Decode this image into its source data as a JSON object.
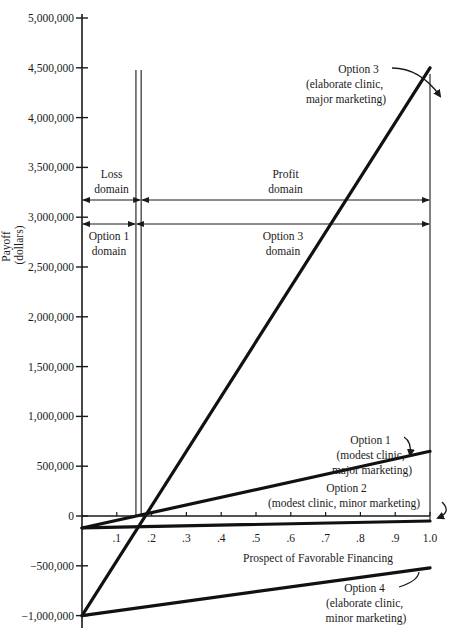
{
  "chart_data": {
    "type": "line",
    "title": "",
    "xlabel": "Prospect of Favorable Financing",
    "ylabel": "Payoff (dollars)",
    "ylabel_lines": [
      "Payoff",
      "(dollars)"
    ],
    "xlim": [
      0,
      1.0
    ],
    "ylim": [
      -1000000,
      5000000
    ],
    "x_ticks": [
      0.1,
      0.2,
      0.3,
      0.4,
      0.5,
      0.6,
      0.7,
      0.8,
      0.9,
      1.0
    ],
    "x_tick_labels": [
      ".1",
      ".2",
      ".3",
      ".4",
      ".5",
      ".6",
      ".7",
      ".8",
      ".9",
      "1.0"
    ],
    "y_ticks": [
      5000000,
      4500000,
      4000000,
      3500000,
      3000000,
      2500000,
      2000000,
      1500000,
      1000000,
      500000,
      0,
      -500000,
      -1000000
    ],
    "y_tick_labels": [
      "5,000,000",
      "4,500,000",
      "4,000,000",
      "3,500,000",
      "3,000,000",
      "2,500,000",
      "2,000,000",
      "1,500,000",
      "1,000,000",
      "500,000",
      "0",
      "−500,000",
      "−1,000,000"
    ],
    "grid": false,
    "legend": "none (inline annotations)",
    "series": [
      {
        "name": "Option 1 (modest clinic, major marketing)",
        "x": [
          0,
          1.0
        ],
        "values": [
          -120000,
          650000
        ]
      },
      {
        "name": "Option 2 (modest clinic, minor marketing)",
        "x": [
          0,
          1.0
        ],
        "values": [
          -120000,
          -50000
        ]
      },
      {
        "name": "Option 3 (elaborate clinic, major marketing)",
        "x": [
          0,
          1.0
        ],
        "values": [
          -1000000,
          4500000
        ]
      },
      {
        "name": "Option 4 (elaborate clinic, minor marketing)",
        "x": [
          0,
          1.0
        ],
        "values": [
          -1000000,
          -520000
        ]
      }
    ],
    "vertical_markers": [
      {
        "x": 0.155,
        "label": "Option 1 / Option 3 crossover"
      },
      {
        "x": 0.17,
        "label": "Breakeven (loss/profit)"
      },
      {
        "x": 1.0,
        "label": "Right boundary"
      }
    ],
    "domains": [
      {
        "row": "top",
        "label": "Loss domain",
        "lines": [
          "Loss",
          "domain"
        ],
        "from": 0,
        "to": 0.17
      },
      {
        "row": "top",
        "label": "Profit domain",
        "lines": [
          "Profit",
          "domain"
        ],
        "from": 0.17,
        "to": 1.0
      },
      {
        "row": "bottom",
        "label": "Option 1 domain",
        "lines": [
          "Option 1",
          "domain"
        ],
        "from": 0,
        "to": 0.155
      },
      {
        "row": "bottom",
        "label": "Option 3 domain",
        "lines": [
          "Option 3",
          "domain"
        ],
        "from": 0.155,
        "to": 1.0
      }
    ],
    "annotations": [
      {
        "id": "opt3",
        "lines": [
          "Option 3",
          "(elaborate clinic,",
          "major marketing)"
        ]
      },
      {
        "id": "opt1",
        "lines": [
          "Option 1",
          "(modest clinic,",
          "major marketing)"
        ]
      },
      {
        "id": "opt2",
        "lines": [
          "Option 2",
          "(modest clinic, minor marketing)"
        ]
      },
      {
        "id": "opt4",
        "lines": [
          "Option 4",
          "(elaborate clinic,",
          "minor marketing)"
        ]
      }
    ]
  }
}
